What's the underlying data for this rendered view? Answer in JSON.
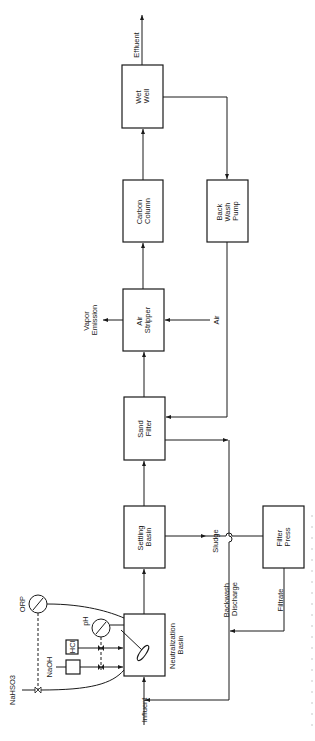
{
  "diagram": {
    "type": "process-flow-diagram",
    "orientation": "rotated-90-ccw",
    "units": [
      {
        "id": "wet_well",
        "lines": [
          "Wet",
          "Well"
        ]
      },
      {
        "id": "carbon_column",
        "lines": [
          "Carbon",
          "Column"
        ]
      },
      {
        "id": "back_wash_pump",
        "lines": [
          "Back",
          "Wash",
          "Pump"
        ]
      },
      {
        "id": "air_stripper",
        "lines": [
          "Air",
          "Stripper"
        ]
      },
      {
        "id": "sand_filter",
        "lines": [
          "Sand",
          "Filter"
        ]
      },
      {
        "id": "settling_basin",
        "lines": [
          "Settling",
          "Basin"
        ]
      },
      {
        "id": "filter_press",
        "lines": [
          "Filter",
          "Press"
        ]
      },
      {
        "id": "neutralization_basin",
        "lines": [
          "Neutralization",
          "Basin"
        ]
      }
    ],
    "streams": {
      "effluent": "Effluent",
      "vapor_emission": [
        "Vapor",
        "Emission"
      ],
      "air": "Air",
      "sludge": "Sludge",
      "backwash_discharge": [
        "Backwash",
        "Discharge"
      ],
      "filtrate": "Filtrate",
      "influent": "Influent"
    },
    "chemicals": {
      "hcl": "HCl",
      "naoh": "NaOH",
      "nahso3": "NaHSO3"
    },
    "instruments": {
      "orp": "ORP",
      "ph": "pH"
    },
    "connections": [
      {
        "from": "Influent",
        "to": "Neutralization Basin"
      },
      {
        "from": "Neutralization Basin",
        "to": "Settling Basin"
      },
      {
        "from": "Settling Basin",
        "to": "Sand Filter"
      },
      {
        "from": "Settling Basin",
        "to": "Filter Press",
        "label": "Sludge"
      },
      {
        "from": "Sand Filter",
        "to": "Air Stripper"
      },
      {
        "from": "Air Stripper",
        "to": "Carbon Column"
      },
      {
        "from": "Air",
        "to": "Air Stripper"
      },
      {
        "from": "Air Stripper",
        "to": "Vapor Emission"
      },
      {
        "from": "Carbon Column",
        "to": "Wet Well"
      },
      {
        "from": "Wet Well",
        "to": "Effluent"
      },
      {
        "from": "Wet Well",
        "to": "Back Wash Pump"
      },
      {
        "from": "Back Wash Pump",
        "to": "Sand Filter"
      },
      {
        "from": "Sand Filter",
        "to": "Neutralization Basin",
        "label": "Backwash Discharge"
      },
      {
        "from": "Filter Press",
        "to": "Neutralization Basin",
        "label": "Filtrate"
      },
      {
        "from": "HCl",
        "to": "Neutralization Basin"
      },
      {
        "from": "NaOH",
        "to": "Neutralization Basin"
      },
      {
        "from": "NaHSO3",
        "to": "Neutralization Basin"
      }
    ]
  }
}
